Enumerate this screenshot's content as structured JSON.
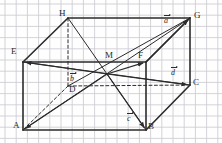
{
  "figure": {
    "kind": "cuboid-vector-diagram",
    "background_color": "#fefefe",
    "grid": {
      "visible": true,
      "cell_px": 11.2,
      "origin_x": 5,
      "origin_y": 4,
      "color": "#c9c9cf",
      "line_width": 0.8
    },
    "stroke_color": "#2b2b2b",
    "edge_width": 1.6,
    "thin_width": 1.0
  },
  "vertices": {
    "A": {
      "label": "A",
      "x": 23,
      "y": 130,
      "label_x": 13,
      "label_y": 121
    },
    "B": {
      "label": "B",
      "x": 146,
      "y": 130,
      "label_x": 148,
      "label_y": 122
    },
    "C": {
      "label": "C",
      "x": 190,
      "y": 85,
      "label_x": 193,
      "label_y": 78
    },
    "D": {
      "label": "D",
      "x": 68,
      "y": 86,
      "label_x": 69,
      "label_y": 85
    },
    "E": {
      "label": "E",
      "x": 23,
      "y": 62,
      "label_x": 11,
      "label_y": 47
    },
    "F": {
      "label": "F",
      "x": 146,
      "y": 62,
      "label_x": 138,
      "label_y": 51
    },
    "G": {
      "label": "G",
      "x": 190,
      "y": 18,
      "label_x": 194,
      "label_y": 11
    },
    "H": {
      "label": "H",
      "x": 68,
      "y": 18,
      "label_x": 59,
      "label_y": 9
    },
    "M": {
      "label": "M",
      "x": 107,
      "y": 74,
      "label_x": 105,
      "label_y": 51
    }
  },
  "vector_labels": [
    {
      "name": "a",
      "text": "a",
      "x": 164,
      "y": 15
    },
    {
      "name": "b",
      "text": "b",
      "x": 70,
      "y": 73
    },
    {
      "name": "c",
      "text": "c",
      "x": 127,
      "y": 113
    },
    {
      "name": "d",
      "text": "d",
      "x": 171,
      "y": 67
    }
  ],
  "edges": [
    {
      "name": "edge-A-B",
      "from": "A",
      "to": "B",
      "style": "solid",
      "weight": "bold"
    },
    {
      "name": "edge-A-E",
      "from": "A",
      "to": "E",
      "style": "solid",
      "weight": "bold"
    },
    {
      "name": "edge-E-F",
      "from": "E",
      "to": "F",
      "style": "solid",
      "weight": "bold"
    },
    {
      "name": "edge-B-F",
      "from": "B",
      "to": "F",
      "style": "solid",
      "weight": "bold"
    },
    {
      "name": "edge-E-H",
      "from": "E",
      "to": "H",
      "style": "solid",
      "weight": "bold"
    },
    {
      "name": "edge-H-G",
      "from": "H",
      "to": "G",
      "style": "solid",
      "weight": "bold"
    },
    {
      "name": "edge-F-G",
      "from": "F",
      "to": "G",
      "style": "solid",
      "weight": "bold"
    },
    {
      "name": "edge-G-C",
      "from": "G",
      "to": "C",
      "style": "solid",
      "weight": "bold"
    },
    {
      "name": "edge-B-C",
      "from": "B",
      "to": "C",
      "style": "solid",
      "weight": "bold"
    },
    {
      "name": "edge-D-H",
      "from": "D",
      "to": "H",
      "style": "dashed",
      "weight": "thin"
    },
    {
      "name": "edge-D-C",
      "from": "D",
      "to": "C",
      "style": "dashed",
      "weight": "thin"
    },
    {
      "name": "edge-D-A",
      "from": "D",
      "to": "A",
      "style": "dashed",
      "weight": "thin"
    },
    {
      "name": "diagonal-E-C",
      "from": "E",
      "to": "C",
      "style": "solid",
      "weight": "thin"
    },
    {
      "name": "diagonal-H-B",
      "from": "H",
      "to": "B",
      "style": "solid",
      "weight": "thin"
    },
    {
      "name": "diagonal-D-G",
      "from": "D",
      "to": "G",
      "style": "solid",
      "weight": "thin"
    },
    {
      "name": "diagonal-A-G",
      "from": "A",
      "to": "G",
      "style": "solid",
      "weight": "thin"
    }
  ],
  "vectors": [
    {
      "name": "vector-a",
      "from": "F",
      "to": "G",
      "label": "a"
    },
    {
      "name": "vector-b",
      "from": "M",
      "to": "E",
      "label": "b"
    },
    {
      "name": "vector-c",
      "from": "M",
      "to": "B",
      "label": "c"
    },
    {
      "name": "vector-d",
      "from": "M",
      "to": "C",
      "label": "d"
    },
    {
      "name": "vector-M-F",
      "from": "M",
      "to": "F",
      "label": ""
    },
    {
      "name": "vector-M-A",
      "from": "M",
      "to": "A",
      "label": ""
    }
  ]
}
